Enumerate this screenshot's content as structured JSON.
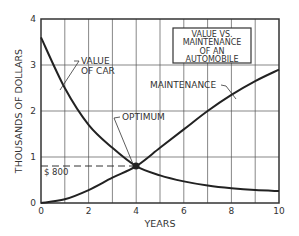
{
  "chart_data": {
    "type": "line",
    "title_lines": [
      "VALUE VS.",
      "MAINTENANCE",
      "OF AN",
      "AUTOMOBILE"
    ],
    "xlabel": "YEARS",
    "ylabel": "THOUSANDS OF DOLLARS",
    "xlim": [
      0,
      10
    ],
    "ylim": [
      0,
      4
    ],
    "x_ticks": [
      "0",
      "2",
      "4",
      "6",
      "8",
      "10"
    ],
    "y_ticks": [
      "0",
      "1",
      "2",
      "3",
      "4"
    ],
    "grid": true,
    "series": [
      {
        "name": "VALUE OF CAR",
        "x": [
          0,
          1,
          2,
          3,
          4,
          5,
          6,
          7,
          8,
          9,
          10
        ],
        "values": [
          3.6,
          2.5,
          1.7,
          1.2,
          0.8,
          0.6,
          0.47,
          0.38,
          0.32,
          0.28,
          0.26
        ]
      },
      {
        "name": "MAINTENANCE",
        "x": [
          0,
          1,
          2,
          3,
          4,
          5,
          6,
          7,
          8,
          9,
          10
        ],
        "values": [
          0,
          0.08,
          0.28,
          0.55,
          0.8,
          1.2,
          1.6,
          2.0,
          2.35,
          2.65,
          2.9
        ]
      }
    ],
    "annotations": [
      {
        "text": "OPTIMUM",
        "x": 4,
        "y": 0.8
      },
      {
        "text": "$ 800",
        "y": 0.8
      }
    ]
  },
  "labels": {
    "value_of_car_1": "VALUE",
    "value_of_car_2": "OF CAR",
    "maintenance": "MAINTENANCE",
    "optimum": "OPTIMUM",
    "dollar_800": "$ 800"
  }
}
